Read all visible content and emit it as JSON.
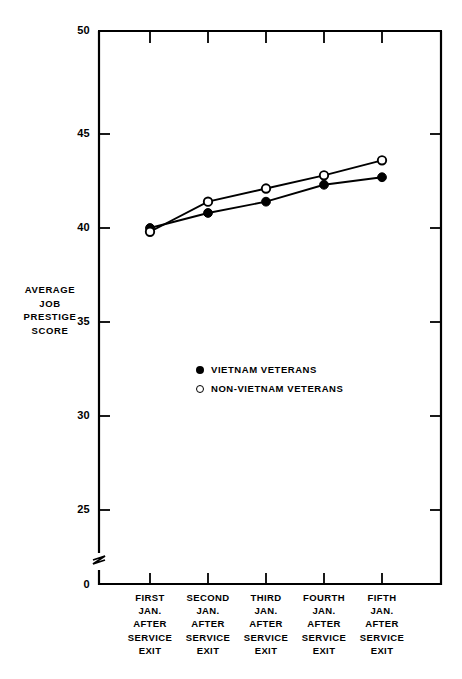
{
  "chart_data": {
    "type": "line",
    "title": "",
    "xlabel": "",
    "ylabel": "AVERAGE JOB PRESTIGE SCORE",
    "ylabel_lines": [
      "AVERAGE",
      "JOB",
      "PRESTIGE",
      "SCORE"
    ],
    "categories": [
      "FIRST JAN. AFTER SERVICE EXIT",
      "SECOND JAN. AFTER SERVICE EXIT",
      "THIRD JAN. AFTER SERVICE EXIT",
      "FOURTH JAN. AFTER SERVICE EXIT",
      "FIFTH JAN. AFTER SERVICE EXIT"
    ],
    "category_lines": [
      [
        "FIRST",
        "JAN.",
        "AFTER",
        "SERVICE",
        "EXIT"
      ],
      [
        "SECOND",
        "JAN.",
        "AFTER",
        "SERVICE",
        "EXIT"
      ],
      [
        "THIRD",
        "JAN.",
        "AFTER",
        "SERVICE",
        "EXIT"
      ],
      [
        "FOURTH",
        "JAN.",
        "AFTER",
        "SERVICE",
        "EXIT"
      ],
      [
        "FIFTH",
        "JAN.",
        "AFTER",
        "SERVICE",
        "EXIT"
      ]
    ],
    "series": [
      {
        "name": "VIETNAM VETERANS",
        "marker": "filled-circle",
        "values": [
          40.0,
          40.8,
          41.4,
          42.3,
          42.7
        ]
      },
      {
        "name": "NON-VIETNAM VETERANS",
        "marker": "open-circle",
        "values": [
          39.8,
          41.4,
          42.1,
          42.8,
          43.6
        ]
      }
    ],
    "ytick_labels": [
      "50",
      "45",
      "40",
      "35",
      "30",
      "25",
      "0"
    ],
    "ytick_values": [
      50,
      45,
      40,
      35,
      30,
      25,
      0
    ],
    "ylim": [
      25,
      50
    ],
    "axis_break": true,
    "axis_break_between": [
      0,
      25
    ],
    "grid": false,
    "legend_position": "inside-lower-left",
    "color_line": "#000000",
    "color_background": "#ffffff"
  },
  "legend": {
    "items": [
      {
        "label": "VIETNAM VETERANS",
        "marker": "filled-circle"
      },
      {
        "label": "NON-VIETNAM VETERANS",
        "marker": "open-circle"
      }
    ]
  }
}
